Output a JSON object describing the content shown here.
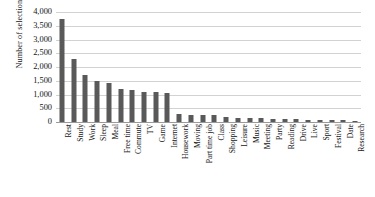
{
  "chart_data": {
    "type": "bar",
    "title": "",
    "xlabel": "",
    "ylabel": "Number of selections",
    "ylim": [
      0,
      4000
    ],
    "ytick_labels": [
      "4,000",
      "3,500",
      "3,000",
      "2,500",
      "2,000",
      "1,500",
      "1,000",
      "500",
      "0"
    ],
    "ytick_values": [
      4000,
      3500,
      3000,
      2500,
      2000,
      1500,
      1000,
      500,
      0
    ],
    "grid": true,
    "legend": "none",
    "bar_color": "#595959",
    "categories": [
      "Rest",
      "Study",
      "Work",
      "Sleep",
      "Meal",
      "Free time",
      "Commute",
      "TV",
      "Game",
      "Internet",
      "Housework",
      "Moving",
      "Part time job",
      "Class",
      "Shopping",
      "Leisure",
      "Music",
      "Meeting",
      "Party",
      "Reading",
      "Drive",
      "Live",
      "Sport",
      "Festival",
      "Date",
      "Research"
    ],
    "values": [
      3750,
      2300,
      1700,
      1500,
      1420,
      1200,
      1180,
      1100,
      1080,
      1050,
      280,
      260,
      250,
      240,
      200,
      150,
      140,
      130,
      120,
      110,
      100,
      90,
      80,
      70,
      60,
      50
    ]
  }
}
